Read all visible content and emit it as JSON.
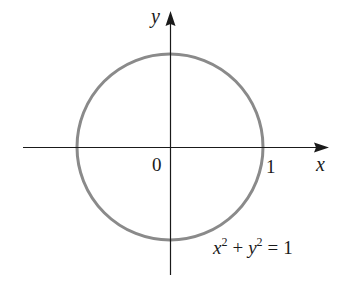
{
  "diagram": {
    "type": "circle-on-axes",
    "axes": {
      "x_label": "x",
      "y_label": "y",
      "origin_label": "0",
      "tick_label_x": "1"
    },
    "curve": {
      "equation_lhs_x": "x",
      "equation_exp1": "2",
      "equation_plus": "+",
      "equation_lhs_y": "y",
      "equation_exp2": "2",
      "equation_eq": "=",
      "equation_rhs": "1",
      "center": [
        0,
        0
      ],
      "radius": 1,
      "stroke_color": "#8a8a8a"
    },
    "axis_color": "#1a1a1a",
    "background": "#ffffff"
  }
}
